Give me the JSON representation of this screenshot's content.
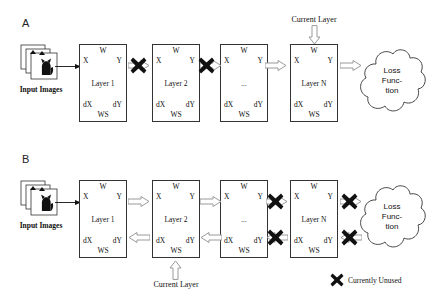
{
  "figure": {
    "panels": [
      {
        "id": "A",
        "label": "A",
        "input": {
          "caption": "Input Images",
          "icon": "photo-stack-cat-icon"
        },
        "layers": [
          {
            "w": "W",
            "x": "X",
            "y": "Y",
            "name": "Layer 1",
            "dx": "dX",
            "dy": "dY",
            "ws": "WS"
          },
          {
            "w": "W",
            "x": "X",
            "y": "Y",
            "name": "Layer 2",
            "dx": "dX",
            "dy": "dY",
            "ws": "WS"
          },
          {
            "w": "W",
            "x": "X",
            "y": "Y",
            "name": "...",
            "dx": "dX",
            "dy": "dY",
            "ws": "WS"
          },
          {
            "w": "W",
            "x": "X",
            "y": "Y",
            "name": "Layer N",
            "dx": "dX",
            "dy": "dY",
            "ws": "WS"
          }
        ],
        "callout": {
          "text": "Current Layer",
          "points_to": "Layer N",
          "direction": "down"
        },
        "loss": {
          "line1": "Loss",
          "line2": "Func-",
          "line3": "tion"
        },
        "forward_connectors": [
          "blocked",
          "blocked",
          "arrow",
          "arrow"
        ],
        "backward_connectors": []
      },
      {
        "id": "B",
        "label": "B",
        "input": {
          "caption": "Input Images",
          "icon": "photo-stack-cat-icon"
        },
        "layers": [
          {
            "w": "W",
            "x": "X",
            "y": "Y",
            "name": "Layer 1",
            "dx": "dX",
            "dy": "dY",
            "ws": "WS"
          },
          {
            "w": "W",
            "x": "X",
            "y": "Y",
            "name": "Layer 2",
            "dx": "dX",
            "dy": "dY",
            "ws": "WS"
          },
          {
            "w": "W",
            "x": "X",
            "y": "Y",
            "name": "...",
            "dx": "dX",
            "dy": "dY",
            "ws": "WS"
          },
          {
            "w": "W",
            "x": "X",
            "y": "Y",
            "name": "Layer N",
            "dx": "dX",
            "dy": "dY",
            "ws": "WS"
          }
        ],
        "callout": {
          "text": "Current Layer",
          "points_to": "Layer 2",
          "direction": "up"
        },
        "loss": {
          "line1": "Loss",
          "line2": "Func-",
          "line3": "tion"
        },
        "forward_connectors": [
          "arrow",
          "arrow",
          "blocked",
          "blocked"
        ],
        "backward_connectors": [
          "arrow",
          "arrow",
          "blocked",
          "blocked"
        ]
      }
    ],
    "legend": {
      "marker": "x-mark-icon",
      "text": "Currently Unused"
    },
    "colors": {
      "stroke": "#333333",
      "arrow_outline": "#9a9a9a",
      "arrow_fill": "#ffffff",
      "x_mark": "#111111",
      "background": "#ffffff"
    }
  }
}
